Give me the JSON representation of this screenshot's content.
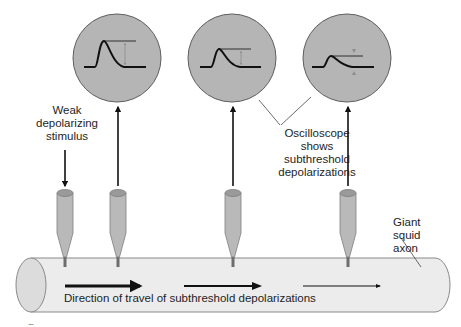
{
  "figure": {
    "colors": {
      "background": "#ffffff",
      "oscilloscope_fill": "#b5b5b5",
      "oscilloscope_border": "#5e5e5e",
      "electrode_fill": "#b9b9b9",
      "electrode_tip": "#6e6e6e",
      "axon_fill": "#ececec",
      "axon_border": "#8a8a8a",
      "trace": "#111111",
      "amplitude_arrow": "#8d8d8d",
      "leader_line": "#444444"
    }
  },
  "labels": {
    "stimulus": [
      "Weak",
      "depolarizing",
      "stimulus"
    ],
    "oscilloscope": [
      "Oscilloscope",
      "shows",
      "subthreshold",
      "depolarizations"
    ],
    "axon": [
      "Giant",
      "squid",
      "axon"
    ],
    "direction": "Direction of travel of subthreshold depolarizations",
    "figure_mark": "–"
  },
  "oscilloscopes": [
    {
      "id": "osc-1",
      "cx": 117,
      "cy": 58,
      "r": 44,
      "peak_height": 24,
      "amplitude_arrows": "down-outward"
    },
    {
      "id": "osc-2",
      "cx": 232,
      "cy": 58,
      "r": 44,
      "peak_height": 16,
      "amplitude_arrows": "down-outward"
    },
    {
      "id": "osc-3",
      "cx": 347,
      "cy": 58,
      "r": 44,
      "peak_height": 9,
      "amplitude_arrows": "inward"
    }
  ],
  "electrodes": [
    {
      "id": "stimulating",
      "x": 65,
      "role": "stimulus",
      "arrow": "down"
    },
    {
      "id": "recording-1",
      "x": 118,
      "role": "recording",
      "arrow": "up",
      "oscilloscope": "osc-1"
    },
    {
      "id": "recording-2",
      "x": 233,
      "role": "recording",
      "arrow": "up",
      "oscilloscope": "osc-2"
    },
    {
      "id": "recording-3",
      "x": 348,
      "role": "recording",
      "arrow": "up",
      "oscilloscope": "osc-3"
    }
  ],
  "propagation_arrows": [
    {
      "x1": 65,
      "x2": 143,
      "y": 286,
      "weight": 3.2
    },
    {
      "x1": 184,
      "x2": 262,
      "y": 286,
      "weight": 2.0
    },
    {
      "x1": 303,
      "x2": 381,
      "y": 286,
      "weight": 1.1
    }
  ]
}
